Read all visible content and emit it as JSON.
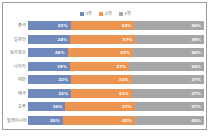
{
  "chart_data": {
    "type": "bar",
    "subtype": "stacked-100-horizontal",
    "title": "",
    "xlabel": "",
    "ylabel": "",
    "xlim": [
      0,
      100
    ],
    "grid": false,
    "legend_position": "top-center",
    "categories": [
      "중국",
      "일본인",
      "싱가포르",
      "나이지",
      "대만",
      "태국",
      "호주",
      "말레이시아"
    ],
    "series": [
      {
        "name": "1위",
        "color": "#7089bd",
        "values": [
          22,
          24,
          20,
          19,
          22,
          22,
          20,
          20
        ]
      },
      {
        "name": "2위",
        "color": "#ed9451",
        "values": [
          33,
          37,
          33,
          27,
          31,
          31,
          37,
          42
        ]
      },
      {
        "name": "3위",
        "color": "#a6a6a6",
        "values": [
          36,
          39,
          36,
          34,
          37,
          37,
          37,
          40
        ]
      }
    ],
    "value_labels": [
      [
        "22%",
        "33%",
        "36%"
      ],
      [
        "24%",
        "37%",
        "39%"
      ],
      [
        "20%",
        "33%",
        "36%"
      ],
      [
        "19%",
        "27%",
        "34%"
      ],
      [
        "22%",
        "31%",
        "37%"
      ],
      [
        "22%",
        "31%",
        "37%"
      ],
      [
        "20%",
        "37%",
        "37%"
      ],
      [
        "20%",
        "42%",
        "40%"
      ]
    ]
  },
  "legend": {
    "items": [
      {
        "label": "1위",
        "color": "#7089bd"
      },
      {
        "label": "2위",
        "color": "#ed9451"
      },
      {
        "label": "3위",
        "color": "#a6a6a6"
      }
    ]
  },
  "colors": {
    "series_1": "#7089bd",
    "series_2": "#ed9451",
    "series_3": "#a6a6a6",
    "frame_border": "#9b9b9b",
    "label_text": "#5e5e5e",
    "value_text": "#ffffff",
    "background": "#ffffff"
  }
}
